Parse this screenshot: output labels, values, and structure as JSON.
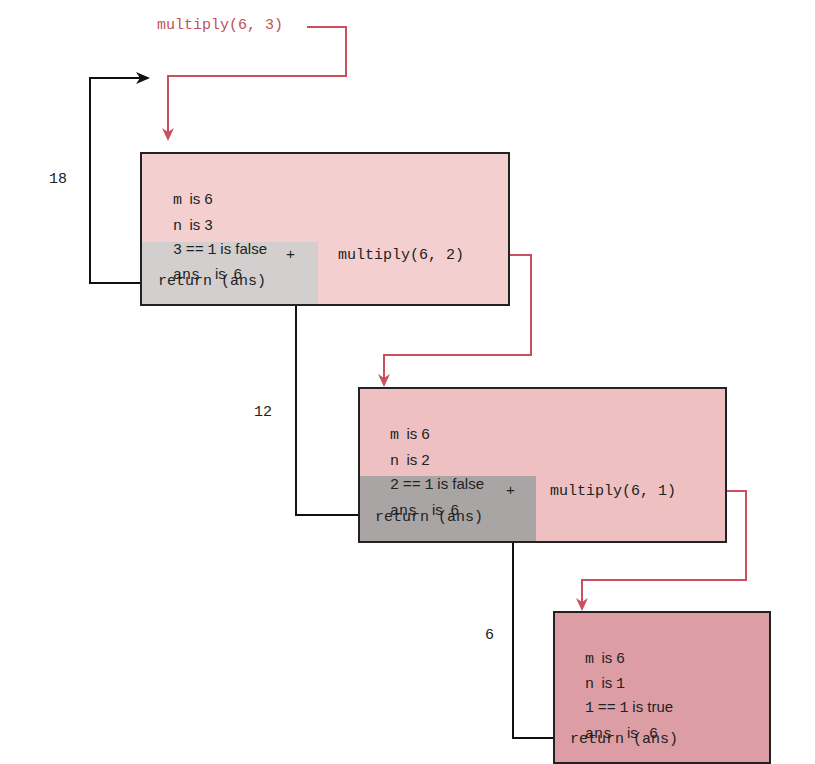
{
  "diagram": {
    "initial_call": "multiply(6, 3)",
    "colors": {
      "call_arrow": "#c9505c",
      "return_arrow": "#111111",
      "frame_border": "#222222",
      "frame_fill_1": "#f4cfcf",
      "frame_fill_2": "#eec0c2",
      "frame_fill_3": "#dc9ea4",
      "shade_1": "#d2cfce",
      "shade_2": "#a9a5a5"
    },
    "frames": [
      {
        "id": "frame-1",
        "lines": {
          "m": [
            "m",
            "is",
            "6"
          ],
          "n": [
            "n",
            "is",
            "3"
          ],
          "cond": [
            "3",
            "==",
            "1",
            "is false"
          ],
          "ans": [
            "ans",
            "is",
            "6",
            "+"
          ],
          "ret": "return (ans)"
        },
        "recursive_call": "multiply(6, 2)"
      },
      {
        "id": "frame-2",
        "lines": {
          "m": [
            "m",
            "is",
            "6"
          ],
          "n": [
            "n",
            "is",
            "2"
          ],
          "cond": [
            "2",
            "==",
            "1",
            "is false"
          ],
          "ans": [
            "ans",
            "is",
            "6",
            "+"
          ],
          "ret": "return (ans)"
        },
        "recursive_call": "multiply(6, 1)"
      },
      {
        "id": "frame-3",
        "lines": {
          "m": [
            "m",
            "is",
            "6"
          ],
          "n": [
            "n",
            "is",
            "1"
          ],
          "cond": [
            "1",
            "==",
            "1",
            "is true"
          ],
          "ans": [
            "ans",
            "is",
            "6"
          ],
          "ret": "return (ans)"
        }
      }
    ],
    "return_values": [
      "18",
      "12",
      "6"
    ]
  }
}
